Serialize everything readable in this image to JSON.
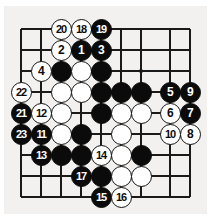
{
  "figure": {
    "type": "go-board-diagram",
    "board_size_shown": 9,
    "columns": 9,
    "rows": 9,
    "background_color": "#f2f1ef",
    "line_color": "#1a1a1a",
    "black_color": "#0b0b0b",
    "white_color": "#ffffff",
    "star_points": [
      {
        "col": 6,
        "row": 2
      }
    ]
  },
  "grid": {
    "col_x": [
      21,
      41,
      61,
      81,
      101,
      121,
      141,
      170,
      190
    ],
    "row_y": [
      29,
      50,
      71,
      92,
      113,
      134,
      155,
      176,
      197
    ],
    "edges": {
      "left": 21,
      "top": 29,
      "right": 190,
      "bottom": 197
    }
  },
  "stones": [
    {
      "col": 2,
      "row": 0,
      "color": "white",
      "label": "20"
    },
    {
      "col": 3,
      "row": 0,
      "color": "white",
      "label": "18"
    },
    {
      "col": 4,
      "row": 0,
      "color": "black",
      "label": "19"
    },
    {
      "col": 2,
      "row": 1,
      "color": "white",
      "label": "2"
    },
    {
      "col": 3,
      "row": 1,
      "color": "black",
      "label": "1"
    },
    {
      "col": 4,
      "row": 1,
      "color": "black",
      "label": "3"
    },
    {
      "col": 1,
      "row": 2,
      "color": "white",
      "label": "4"
    },
    {
      "col": 2,
      "row": 2,
      "color": "black",
      "label": ""
    },
    {
      "col": 3,
      "row": 2,
      "color": "white",
      "label": ""
    },
    {
      "col": 4,
      "row": 2,
      "color": "black",
      "label": ""
    },
    {
      "col": 0,
      "row": 3,
      "color": "white",
      "label": "22"
    },
    {
      "col": 2,
      "row": 3,
      "color": "white",
      "label": ""
    },
    {
      "col": 3,
      "row": 3,
      "color": "white",
      "label": ""
    },
    {
      "col": 4,
      "row": 3,
      "color": "black",
      "label": ""
    },
    {
      "col": 5,
      "row": 3,
      "color": "black",
      "label": ""
    },
    {
      "col": 6,
      "row": 3,
      "color": "black",
      "label": ""
    },
    {
      "col": 7,
      "row": 3,
      "color": "black",
      "label": "5"
    },
    {
      "col": 8,
      "row": 3,
      "color": "black",
      "label": "9"
    },
    {
      "col": 0,
      "row": 4,
      "color": "black",
      "label": "21"
    },
    {
      "col": 1,
      "row": 4,
      "color": "white",
      "label": "12"
    },
    {
      "col": 2,
      "row": 4,
      "color": "white",
      "label": ""
    },
    {
      "col": 4,
      "row": 4,
      "color": "black",
      "label": ""
    },
    {
      "col": 5,
      "row": 4,
      "color": "white",
      "label": ""
    },
    {
      "col": 6,
      "row": 4,
      "color": "white",
      "label": ""
    },
    {
      "col": 7,
      "row": 4,
      "color": "white",
      "label": "6"
    },
    {
      "col": 8,
      "row": 4,
      "color": "black",
      "label": "7"
    },
    {
      "col": 0,
      "row": 5,
      "color": "black",
      "label": "23"
    },
    {
      "col": 1,
      "row": 5,
      "color": "black",
      "label": "11"
    },
    {
      "col": 2,
      "row": 5,
      "color": "white",
      "label": ""
    },
    {
      "col": 3,
      "row": 5,
      "color": "black",
      "label": ""
    },
    {
      "col": 5,
      "row": 5,
      "color": "white",
      "label": ""
    },
    {
      "col": 7,
      "row": 5,
      "color": "white",
      "label": "10"
    },
    {
      "col": 8,
      "row": 5,
      "color": "white",
      "label": "8"
    },
    {
      "col": 1,
      "row": 6,
      "color": "black",
      "label": "13"
    },
    {
      "col": 2,
      "row": 6,
      "color": "black",
      "label": ""
    },
    {
      "col": 3,
      "row": 6,
      "color": "black",
      "label": ""
    },
    {
      "col": 4,
      "row": 6,
      "color": "white",
      "label": "14"
    },
    {
      "col": 5,
      "row": 6,
      "color": "white",
      "label": ""
    },
    {
      "col": 6,
      "row": 6,
      "color": "black",
      "label": ""
    },
    {
      "col": 3,
      "row": 7,
      "color": "black",
      "label": "17"
    },
    {
      "col": 4,
      "row": 7,
      "color": "black",
      "label": ""
    },
    {
      "col": 5,
      "row": 7,
      "color": "white",
      "label": ""
    },
    {
      "col": 6,
      "row": 7,
      "color": "white",
      "label": ""
    },
    {
      "col": 4,
      "row": 8,
      "color": "black",
      "label": "15"
    },
    {
      "col": 5,
      "row": 8,
      "color": "white",
      "label": "16"
    }
  ]
}
